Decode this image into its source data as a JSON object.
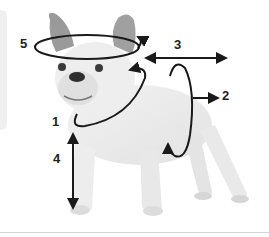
{
  "diagram": {
    "labels": [
      {
        "id": "1",
        "text": "1",
        "meaning": "neck"
      },
      {
        "id": "2",
        "text": "2",
        "meaning": "chest"
      },
      {
        "id": "3",
        "text": "3",
        "meaning": "back length"
      },
      {
        "id": "4",
        "text": "4",
        "meaning": "height"
      },
      {
        "id": "5",
        "text": "5",
        "meaning": "head"
      }
    ]
  },
  "colors": {
    "annotation": "#1a1a1a",
    "panel": "#efefef",
    "rule": "#d6d6d6"
  }
}
